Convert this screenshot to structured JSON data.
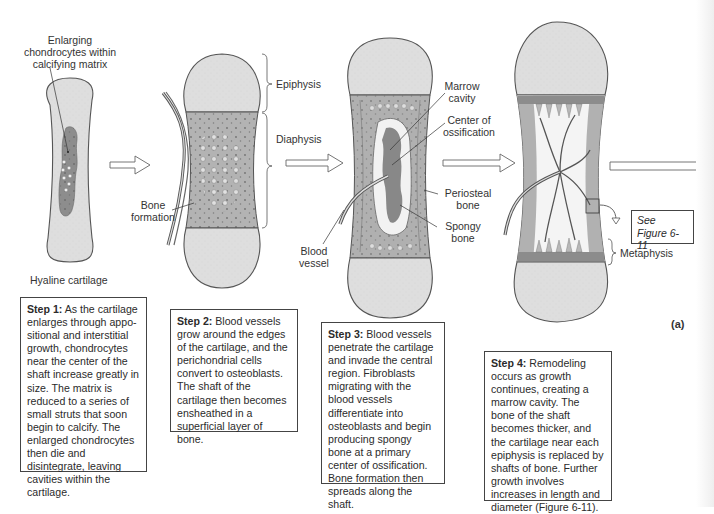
{
  "figure": {
    "panel_label": "(a)",
    "colors": {
      "cartilage": "#dcdcdc",
      "calcified_matrix": "#8f8f8f",
      "bone_shaft": "#a9a9a9",
      "outline": "#555555",
      "vessel": "#6a6a6a"
    }
  },
  "stages": [
    {
      "id": "step1",
      "labels": {
        "top": "Enlarging chondrocytes within calcifying matrix",
        "top_lines": [
          "Enlarging",
          "chondrocytes within",
          "calcifying matrix"
        ],
        "bottom": "Hyaline cartilage"
      },
      "step": {
        "title": "Step 1:",
        "text": "As the cartilage enlarges through appo-sitional and interstitial growth, chondrocytes near the center of the shaft increase greatly in size. The matrix is reduced to a series of small struts that soon begin to calcify. The enlarged chondrocytes then die and disintegrate, leaving cavities within the cartilage."
      }
    },
    {
      "id": "step2",
      "labels": {
        "epiphysis": "Epiphysis",
        "diaphysis": "Diaphysis",
        "bone_formation_lines": [
          "Bone",
          "formation"
        ]
      },
      "step": {
        "title": "Step 2:",
        "text": "Blood vessels grow around the edges of the cartilage, and the perichondrial cells convert to osteoblasts. The shaft of the cartilage then becomes ensheathed in a superficial layer of bone."
      }
    },
    {
      "id": "step3",
      "labels": {
        "marrow_cavity_lines": [
          "Marrow",
          "cavity"
        ],
        "center_ossification_lines": [
          "Center of",
          "ossification"
        ],
        "periosteal_bone_lines": [
          "Periosteal",
          "bone"
        ],
        "spongy_bone_lines": [
          "Spongy",
          "bone"
        ],
        "blood_vessel_lines": [
          "Blood",
          "vessel"
        ]
      },
      "step": {
        "title": "Step 3:",
        "text": "Blood vessels penetrate the cartilage and invade the central region. Fibroblasts migrating with the blood vessels differentiate into osteoblasts and begin producing spongy bone at a primary center of ossification.  Bone formation then spreads along the shaft."
      }
    },
    {
      "id": "step4",
      "labels": {
        "see_figure_lines": [
          "See",
          "Figure 6-11"
        ],
        "metaphysis": "Metaphysis"
      },
      "step": {
        "title": "Step 4:",
        "text": "Remodeling occurs as growth continues, creating a marrow cavity. The bone of the shaft becomes thicker, and the cartilage near each epiphysis is replaced by shafts of bone. Further growth involves increases in length and diameter (Figure 6-11)."
      }
    }
  ]
}
